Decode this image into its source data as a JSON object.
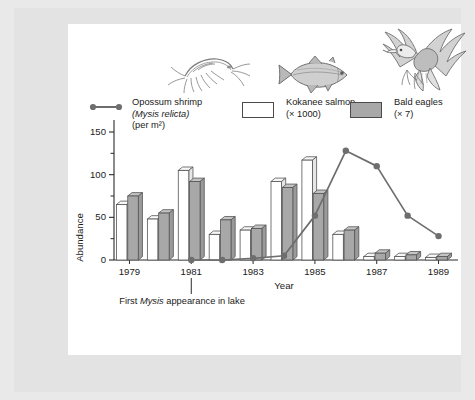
{
  "figure": {
    "background_color": "#e3e3e3",
    "plot_background_color": "#ffffff"
  },
  "legend": {
    "items": [
      {
        "key": "opossum-shrimp",
        "swatch": "line-with-dots",
        "line1": "Opossum shrimp",
        "line2": "(Mysis relicta)",
        "line3": "(per m²)",
        "color": "#6e6e6e"
      },
      {
        "key": "kokanee-salmon",
        "swatch": "open-box",
        "line1": "Kokanee salmon",
        "line2": "(× 1000)",
        "line3": "",
        "color": "#ffffff"
      },
      {
        "key": "bald-eagles",
        "swatch": "filled-box",
        "line1": "Bald eagles",
        "line2": "(× 7)",
        "line3": "",
        "color": "#a8a8a8"
      }
    ]
  },
  "illustrations": [
    {
      "name": "opossum-shrimp-illustration",
      "label": "opossum shrimp"
    },
    {
      "name": "kokanee-salmon-illustration",
      "label": "kokanee salmon"
    },
    {
      "name": "bald-eagle-illustration",
      "label": "bald eagle"
    }
  ],
  "annotation": {
    "prefix": "First ",
    "italic": "Mysis",
    "suffix": " appearance in lake",
    "at_year": 1981
  },
  "chart_data": {
    "type": "bar",
    "title": "",
    "xlabel": "Year",
    "ylabel": "Abundance",
    "ylim": [
      0,
      150
    ],
    "yticks": [
      0,
      50,
      100,
      150
    ],
    "yticks_minor": [
      25,
      75,
      125
    ],
    "ytick_labels": [
      "0",
      "50",
      "100",
      "150"
    ],
    "grid": false,
    "legend_position": "top",
    "categories": [
      1979,
      1980,
      1981,
      1982,
      1983,
      1984,
      1985,
      1986,
      1987,
      1988,
      1989
    ],
    "xtick_labels": [
      "1979",
      "1981",
      "1983",
      "1985",
      "1987",
      "1989"
    ],
    "xticks": [
      1979,
      1981,
      1983,
      1985,
      1987,
      1989
    ],
    "series": [
      {
        "name": "Kokanee salmon",
        "unit": "× 1000",
        "render": "bar",
        "color": "#ffffff",
        "edge_color": "#555555",
        "values": [
          65,
          48,
          105,
          30,
          35,
          92,
          117,
          30,
          4,
          4,
          3
        ]
      },
      {
        "name": "Bald eagles",
        "unit": "× 7",
        "render": "bar",
        "color": "#a8a8a8",
        "edge_color": "#555555",
        "values": [
          75,
          55,
          92,
          47,
          37,
          85,
          78,
          35,
          8,
          6,
          4
        ]
      },
      {
        "name": "Opossum shrimp",
        "unit": "per m²",
        "render": "line",
        "color": "#6e6e6e",
        "marker": "circle",
        "x": [
          1981,
          1982,
          1983,
          1984,
          1985,
          1986,
          1987,
          1988,
          1989
        ],
        "values": [
          0,
          0,
          2,
          5,
          52,
          128,
          110,
          52,
          28
        ]
      }
    ]
  }
}
